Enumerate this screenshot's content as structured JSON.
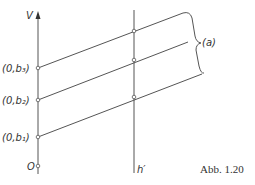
{
  "figure": {
    "caption": "Abb. 1.20",
    "y_axis_label": "V",
    "second_axis_label": "h′",
    "origin_label": "O",
    "brace_label": "(a)",
    "points": [
      {
        "label": "(0,b₁)",
        "y_axis_y": 137,
        "h_line_y": 97
      },
      {
        "label": "(0,b₂)",
        "y_axis_y": 100,
        "h_line_y": 60
      },
      {
        "label": "(0,b₃)",
        "y_axis_y": 68,
        "h_line_y": 30
      }
    ]
  }
}
